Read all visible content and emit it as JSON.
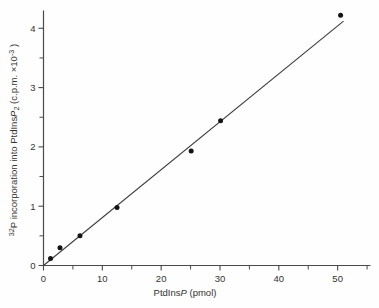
{
  "figure": {
    "background": "#fefefe"
  },
  "chart_data": {
    "type": "scatter",
    "title": "",
    "xlabel": "PtdInsP (pmol)",
    "ylabel": "32P incorporation into PtdInsP2 (c.p.m. ×10-3)",
    "xlabel_parts": [
      {
        "t": "PtdIns"
      },
      {
        "t": "P",
        "style": "italic"
      },
      {
        "t": " (pmol)"
      }
    ],
    "ylabel_parts": [
      {
        "t": "32",
        "pos": "sup"
      },
      {
        "t": "P incorporation into PtdIns"
      },
      {
        "t": "P",
        "style": "italic"
      },
      {
        "t": "2",
        "pos": "sub"
      },
      {
        "t": " (c.p.m. ×10",
        "space_before": true
      },
      {
        "t": "-3",
        "pos": "sup"
      },
      {
        "t": " )"
      }
    ],
    "x": [
      1.2,
      2.8,
      6.2,
      12.5,
      25.1,
      30.1,
      50.5
    ],
    "y": [
      0.12,
      0.3,
      0.5,
      0.98,
      1.93,
      2.44,
      4.22
    ],
    "fit_line": {
      "x1": 0,
      "y1": 0,
      "x2": 51.0,
      "y2": 4.12
    },
    "xlim": [
      0,
      55.5
    ],
    "ylim": [
      0,
      4.3
    ],
    "x_major_ticks": [
      0,
      10,
      20,
      30,
      40,
      50
    ],
    "x_minor_ticks": [
      5,
      15,
      25,
      35,
      45,
      55
    ],
    "y_major_ticks": [
      0,
      1,
      2,
      3,
      4
    ],
    "y_minor_ticks": [
      0.5,
      1.5,
      2.5,
      3.5
    ],
    "grid": false,
    "legend": null,
    "marker": {
      "shape": "circle",
      "radius": 2.5,
      "color": "#141414"
    },
    "line_color": "#3c3c3c",
    "axis_color": "#4a4a4a",
    "text_color": "#333333",
    "tick_font_px": 9.5,
    "label_font_px": 9.5
  }
}
